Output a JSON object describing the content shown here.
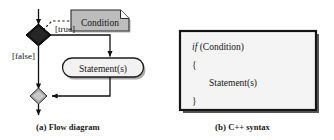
{
  "figure": {
    "background_color": "#ffffff",
    "panels": [
      {
        "id": "a",
        "caption_label": "(a)",
        "caption_text": "Flow diagram",
        "type": "flow-diagram"
      },
      {
        "id": "b",
        "caption_label": "(b)",
        "caption_text": "C++ syntax",
        "type": "code-box"
      }
    ]
  },
  "flow_diagram": {
    "note": {
      "label": "Condition",
      "fill": "#bdbdbd",
      "border": "#2b2b2b",
      "shape": "note-folded-corner"
    },
    "decision": {
      "label": "",
      "fill": "#121212",
      "border": "#000000",
      "shape": "diamond"
    },
    "merge": {
      "label": "",
      "fill": "#a8a8a8",
      "border": "#2b2b2b",
      "shape": "diamond"
    },
    "action": {
      "label": "Statement(s)",
      "fill": "#f2f2f2",
      "border": "#1c1c1c",
      "shape": "rounded-rectangle"
    },
    "edges": [
      {
        "name": "entry-arrow",
        "label": "",
        "style": "solid"
      },
      {
        "name": "true-branch",
        "label": "[true]",
        "style": "solid"
      },
      {
        "name": "false-branch",
        "label": "[false]",
        "style": "solid"
      },
      {
        "name": "condition-link",
        "label": "",
        "style": "dashed"
      },
      {
        "name": "statement-to-merge",
        "label": "",
        "style": "solid"
      },
      {
        "name": "exit-arrow",
        "label": "",
        "style": "solid"
      }
    ]
  },
  "code_box": {
    "fill": "#f4f4f4",
    "border": "#141414",
    "lines": [
      {
        "keyword": "if",
        "rest": " (Condition)",
        "indent": 0
      },
      {
        "keyword": "",
        "rest": "{",
        "indent": 0
      },
      {
        "keyword": "",
        "rest": "Statement(s)",
        "indent": 1
      },
      {
        "keyword": "",
        "rest": "}",
        "indent": 0
      }
    ]
  }
}
